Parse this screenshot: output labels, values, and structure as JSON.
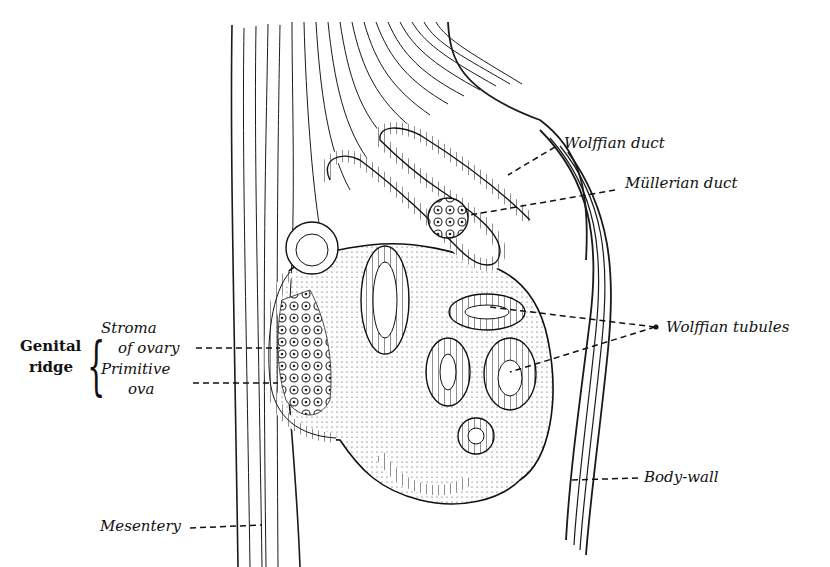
{
  "figure": {
    "type": "anatomical-section",
    "colors": {
      "ink": "#111111",
      "paper": "#ffffff"
    }
  },
  "labels": {
    "wolffian_duct": "Wolffian duct",
    "mullerian_duct": "Müllerian duct",
    "wolffian_tubules": "Wolffian tubules",
    "body_wall": "Body-wall",
    "mesentery": "Mesentery",
    "genital_ridge": {
      "line1": "Genital",
      "line2": "ridge",
      "stroma_line1": "Stroma",
      "stroma_line2": "of ovary",
      "ova_line1": "Primitive",
      "ova_line2": "ova"
    }
  }
}
